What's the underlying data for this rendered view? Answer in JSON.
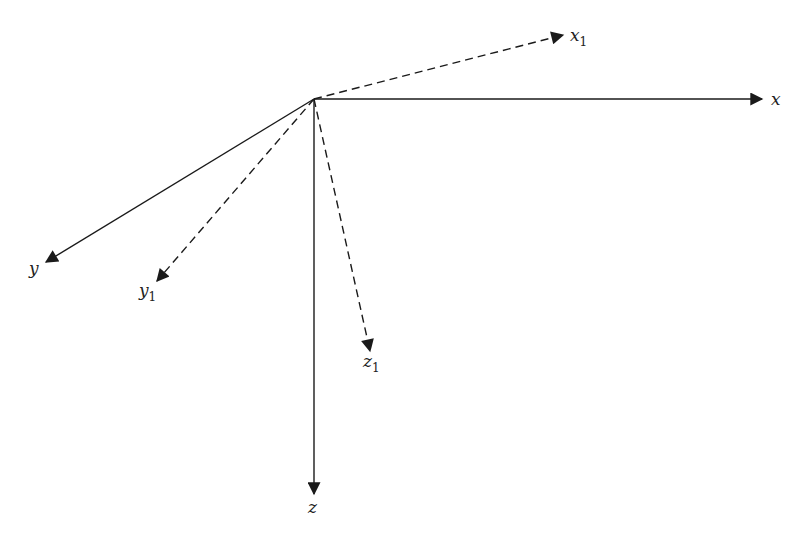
{
  "diagram": {
    "title": "",
    "line_color": "#1a1a1a",
    "axes": [
      {
        "id": "x",
        "label": "x",
        "subscript": "",
        "style": "solid"
      },
      {
        "id": "y",
        "label": "y",
        "subscript": "",
        "style": "solid"
      },
      {
        "id": "z",
        "label": "z",
        "subscript": "",
        "style": "solid"
      },
      {
        "id": "x1",
        "label": "x",
        "subscript": "1",
        "style": "dashed"
      },
      {
        "id": "y1",
        "label": "y",
        "subscript": "1",
        "style": "dashed"
      },
      {
        "id": "z1",
        "label": "z",
        "subscript": "1",
        "style": "dashed"
      }
    ]
  }
}
